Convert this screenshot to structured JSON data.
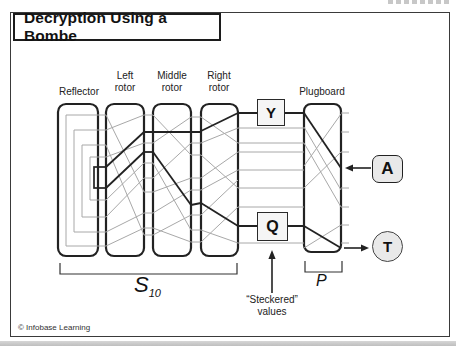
{
  "title": "Decryption Using a Bombe",
  "copyright": "© Infobase Learning",
  "labels": {
    "reflector": "Reflector",
    "left_rotor": "Left\nrotor",
    "middle_rotor": "Middle\nrotor",
    "right_rotor": "Right\nrotor",
    "plugboard": "Plugboard",
    "s_main": "S",
    "s_sub": "10",
    "p": "P",
    "steckered": "“Steckered”\nvalues"
  },
  "letters": {
    "y": "Y",
    "q": "Q",
    "a": "A",
    "t": "T"
  },
  "colors": {
    "dark": "#222222",
    "wire": "#a8a8a8",
    "badge": "#e9e9e9",
    "box": "#f5f5f5",
    "frame": "#3a3a3a"
  }
}
